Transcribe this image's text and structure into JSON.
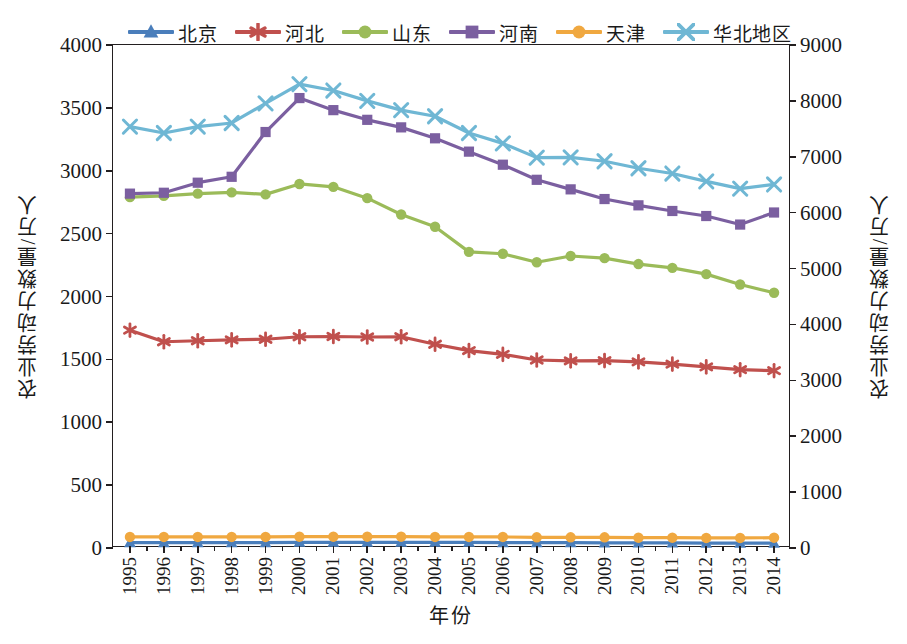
{
  "chart_data": {
    "type": "line",
    "title": "",
    "xlabel": "年份",
    "ylabel": "农业劳动力数量/万人",
    "ylabel_right": "农业劳动力数量/万人",
    "x": [
      "1995",
      "1996",
      "1997",
      "1998",
      "1999",
      "2000",
      "2001",
      "2002",
      "2003",
      "2004",
      "2005",
      "2006",
      "2007",
      "2008",
      "2009",
      "2010",
      "2011",
      "2012",
      "2013",
      "2014"
    ],
    "ylim": [
      0,
      4000
    ],
    "yticks": [
      "0",
      "500",
      "1000",
      "1500",
      "2000",
      "2500",
      "3000",
      "3500",
      "4000"
    ],
    "ylim_right": [
      0,
      9000
    ],
    "yticks_right": [
      "0",
      "1000",
      "2000",
      "3000",
      "4000",
      "5000",
      "6000",
      "7000",
      "8000",
      "9000"
    ],
    "grid": false,
    "legend_position": "top",
    "series": [
      {
        "name": "北京",
        "color": "#4A7EBB",
        "marker": "triangle",
        "axis": "left",
        "values": [
          42,
          42,
          42,
          42,
          42,
          45,
          45,
          45,
          45,
          45,
          45,
          42,
          42,
          42,
          40,
          40,
          40,
          38,
          38,
          38
        ]
      },
      {
        "name": "河北",
        "color": "#C0504D",
        "marker": "asterisk",
        "axis": "left",
        "values": [
          1732,
          1640,
          1648,
          1655,
          1660,
          1680,
          1682,
          1678,
          1680,
          1620,
          1570,
          1540,
          1495,
          1488,
          1490,
          1480,
          1462,
          1440,
          1418,
          1410
        ]
      },
      {
        "name": "山东",
        "color": "#9BBB59",
        "marker": "circle",
        "axis": "left",
        "values": [
          2790,
          2800,
          2818,
          2828,
          2812,
          2895,
          2872,
          2782,
          2652,
          2555,
          2355,
          2340,
          2272,
          2322,
          2305,
          2258,
          2228,
          2178,
          2095,
          2030
        ]
      },
      {
        "name": "河南",
        "color": "#7B5FA0",
        "marker": "square",
        "axis": "left",
        "values": [
          2818,
          2825,
          2905,
          2952,
          3308,
          3578,
          3482,
          3405,
          3345,
          3258,
          3152,
          3048,
          2928,
          2852,
          2775,
          2725,
          2680,
          2640,
          2572,
          2668
        ]
      },
      {
        "name": "天津",
        "color": "#F0A840",
        "marker": "circle",
        "axis": "left",
        "values": [
          88,
          88,
          88,
          88,
          88,
          90,
          90,
          90,
          90,
          88,
          88,
          88,
          85,
          85,
          85,
          82,
          82,
          80,
          80,
          82
        ]
      },
      {
        "name": "华北地区",
        "color": "#6FB7D4",
        "marker": "x",
        "axis": "right",
        "values": [
          7540,
          7425,
          7540,
          7605,
          7955,
          8300,
          8185,
          8000,
          7835,
          7725,
          7425,
          7240,
          6985,
          6990,
          6920,
          6795,
          6700,
          6560,
          6430,
          6505
        ]
      }
    ]
  },
  "legend": {
    "items": [
      {
        "label": "北京"
      },
      {
        "label": "河北"
      },
      {
        "label": "山东"
      },
      {
        "label": "河南"
      },
      {
        "label": "天津"
      },
      {
        "label": "华北地区"
      }
    ]
  }
}
